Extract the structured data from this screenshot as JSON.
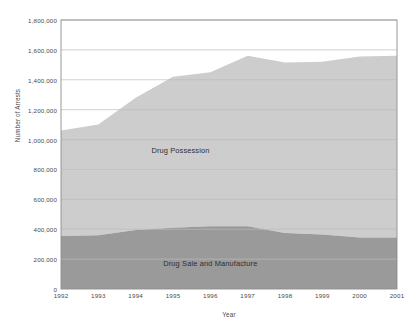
{
  "chart_data": {
    "type": "area",
    "title": "",
    "xlabel": "Year",
    "ylabel": "Number of Arrests",
    "stacked": true,
    "grid": true,
    "legend_position": "inline-labels",
    "x": [
      1992,
      1993,
      1994,
      1995,
      1996,
      1997,
      1998,
      1999,
      2000,
      2001
    ],
    "xtick_labels": [
      "1992",
      "1993",
      "1994",
      "1995",
      "1996",
      "1997",
      "1998",
      "1999",
      "2000",
      "2001"
    ],
    "xlim": [
      1992,
      2001
    ],
    "ylim": [
      0,
      1800000
    ],
    "ytick_values": [
      0,
      200000,
      400000,
      600000,
      800000,
      1000000,
      1200000,
      1400000,
      1600000,
      1800000
    ],
    "ytick_labels": [
      "0",
      "200,000",
      "400,000",
      "600,000",
      "800,000",
      "1,000,000",
      "1,200,000",
      "1,400,000",
      "1,600,000",
      "1,800,000"
    ],
    "series": [
      {
        "name": "Drug Sale and Manufacture",
        "color": "#9a9a9a",
        "label_x": 1996.0,
        "label_y": 175000,
        "values": [
          355000,
          360000,
          395000,
          410000,
          420000,
          420000,
          375000,
          365000,
          345000,
          345000
        ]
      },
      {
        "name": "Drug Possession",
        "color": "#cdcdcd",
        "label_x": 1995.2,
        "label_y": 930000,
        "values": [
          705000,
          740000,
          885000,
          1010000,
          1030000,
          1140000,
          1140000,
          1155000,
          1210000,
          1215000
        ]
      }
    ],
    "totals": [
      1060000,
      1100000,
      1280000,
      1420000,
      1450000,
      1560000,
      1515000,
      1520000,
      1555000,
      1560000
    ],
    "colors": {
      "possession": "#cdcdcd",
      "sale": "#9a9a9a",
      "grid": "#bcbcbc",
      "axis": "#8f8f8f",
      "text": "#4a4a4a",
      "background": "#ffffff"
    }
  }
}
